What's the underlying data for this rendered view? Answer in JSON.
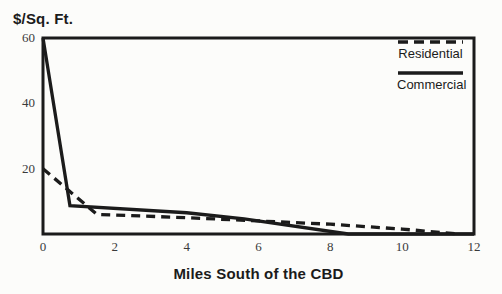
{
  "figure": {
    "background": "#fcfcfa",
    "ink_color": "#1b1b1b"
  },
  "chart_data": {
    "type": "line",
    "title": "",
    "ylabel": "$/Sq. Ft.",
    "xlabel": "Miles South of the CBD",
    "xlim": [
      0,
      12
    ],
    "ylim": [
      0,
      60
    ],
    "x_ticks": [
      0,
      2,
      4,
      6,
      8,
      10,
      12
    ],
    "y_ticks": [
      20,
      40,
      60
    ],
    "grid": false,
    "frame": "full-box",
    "legend_position": "top-right-inside",
    "series": [
      {
        "name": "Residential",
        "style": "dashed",
        "color": "#1b1b1b",
        "points": [
          [
            0,
            20
          ],
          [
            1.5,
            6
          ],
          [
            4,
            5
          ],
          [
            6,
            4
          ],
          [
            8,
            3
          ],
          [
            10,
            1.5
          ],
          [
            11.6,
            0
          ]
        ]
      },
      {
        "name": "Commercial",
        "style": "solid",
        "color": "#1b1b1b",
        "points": [
          [
            0,
            60
          ],
          [
            0.75,
            8.7
          ],
          [
            4,
            6.5
          ],
          [
            5.6,
            4.6
          ],
          [
            8.5,
            0
          ],
          [
            12,
            0
          ]
        ]
      }
    ]
  }
}
